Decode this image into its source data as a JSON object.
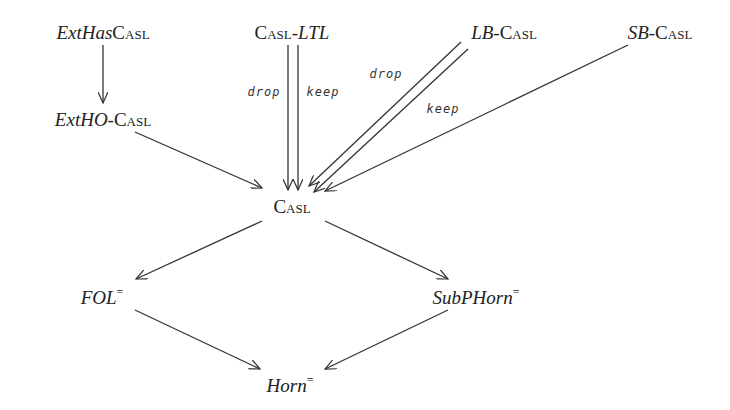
{
  "nodes": {
    "exthascasl": {
      "italic": "ExtHas",
      "smallcaps": "Casl"
    },
    "exthocasl": {
      "italic": "ExtHO",
      "sep": "-",
      "smallcaps": "Casl"
    },
    "casl_ltl": {
      "smallcaps": "Casl",
      "sep": "-",
      "italic": "LTL"
    },
    "lbcasl": {
      "italic": "LB",
      "sep": "-",
      "smallcaps": "Casl"
    },
    "sbcasl": {
      "italic": "SB",
      "sep": "-",
      "smallcaps": "Casl"
    },
    "casl": {
      "smallcaps": "Casl"
    },
    "fol": {
      "italic": "FOL",
      "sup": "="
    },
    "subphorn": {
      "italic": "SubPHorn",
      "sup": "="
    },
    "horn": {
      "italic": "Horn",
      "sup": "="
    }
  },
  "edge_labels": {
    "ltl_drop": "drop",
    "ltl_keep": "keep",
    "lb_drop": "drop",
    "lb_keep": "keep"
  },
  "edges": [
    {
      "from": "ExtHasCASL",
      "to": "ExtHO-CASL"
    },
    {
      "from": "ExtHO-CASL",
      "to": "CASL"
    },
    {
      "from": "CASL-LTL",
      "to": "CASL",
      "label": "drop"
    },
    {
      "from": "CASL-LTL",
      "to": "CASL",
      "label": "keep"
    },
    {
      "from": "LB-CASL",
      "to": "CASL",
      "label": "drop"
    },
    {
      "from": "LB-CASL",
      "to": "CASL",
      "label": "keep"
    },
    {
      "from": "SB-CASL",
      "to": "CASL"
    },
    {
      "from": "CASL",
      "to": "FOL="
    },
    {
      "from": "CASL",
      "to": "SubPHorn="
    },
    {
      "from": "FOL=",
      "to": "Horn="
    },
    {
      "from": "SubPHorn=",
      "to": "Horn="
    }
  ],
  "colors": {
    "line": "#333333",
    "text": "#222222",
    "background": "#ffffff"
  }
}
